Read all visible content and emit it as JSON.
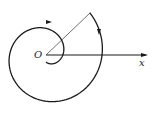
{
  "figure": {
    "type": "polar spiral diagram",
    "origin_label": "O",
    "axis_label": "x",
    "colors": {
      "stroke": "#1a1a1a",
      "background": "#ffffff"
    },
    "origin_px": [
      46,
      55
    ],
    "axis_end_px": [
      148,
      55
    ],
    "spiral": {
      "kind": "archimedean",
      "start_angle_deg": -90,
      "end_angle_deg": 780,
      "start_radius_px": 6,
      "radius_growth_px_per_rev": 30,
      "end_point_px": [
        90,
        13
      ]
    },
    "ray_to_spiral_end": {
      "from_px": [
        46,
        55
      ],
      "to_px": [
        90,
        13
      ]
    },
    "arrows": [
      {
        "position_px": [
          49,
          22
        ],
        "direction": "right"
      },
      {
        "position_px": [
          99,
          32
        ],
        "direction": "down"
      }
    ]
  }
}
